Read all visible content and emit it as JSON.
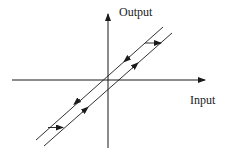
{
  "diagram": {
    "type": "hysteresis-loop",
    "axes": {
      "x_label": "Input",
      "y_label": "Output"
    },
    "branches": [
      {
        "name": "descending-branch",
        "direction": "down"
      },
      {
        "name": "ascending-branch",
        "direction": "up"
      }
    ],
    "transitions": [
      {
        "name": "top-transition",
        "direction": "right"
      },
      {
        "name": "bottom-transition",
        "direction": "right"
      }
    ],
    "colors": {
      "line": "#1a1a1a",
      "background": "#ffffff"
    }
  }
}
